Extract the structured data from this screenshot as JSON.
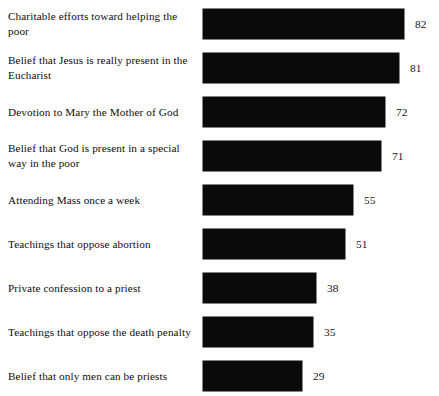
{
  "chart_data": {
    "type": "bar",
    "orientation": "horizontal",
    "title": "",
    "subtitle": "",
    "xlabel": "",
    "ylabel": "",
    "grid": false,
    "legend": null,
    "axis_visible": false,
    "tick_labels": [],
    "value_labels_shown": true,
    "bar_color": "#0a0a0a",
    "background_color": "#ffffff",
    "xlim": [
      0,
      100
    ],
    "categories": [
      "Charitable efforts toward helping the poor",
      "Belief that Jesus is really present in the Eucharist",
      "Devotion to Mary the Mother of God",
      "Belief that God is present in a special way in the poor",
      "Attending Mass once a week",
      "Teachings that oppose abortion",
      "Private confession to a priest",
      "Teachings that oppose the death penalty",
      "Belief that only men can be priests"
    ],
    "values": [
      82,
      81,
      72,
      71,
      55,
      51,
      38,
      35,
      29
    ],
    "bars": [
      {
        "label": "Charitable efforts toward helping the poor",
        "value": 82,
        "value_text": "82",
        "pixel_width": 201
      },
      {
        "label": "Belief that Jesus is really present in the Eucharist",
        "value": 81,
        "value_text": "81",
        "pixel_width": 196
      },
      {
        "label": "Devotion to Mary the Mother of God",
        "value": 72,
        "value_text": "72",
        "pixel_width": 182
      },
      {
        "label": "Belief that God is present in a special way in the poor",
        "value": 71,
        "value_text": "71",
        "pixel_width": 178
      },
      {
        "label": "Attending Mass once a week",
        "value": 55,
        "value_text": "55",
        "pixel_width": 150
      },
      {
        "label": "Teachings that oppose abortion",
        "value": 51,
        "value_text": "51",
        "pixel_width": 142
      },
      {
        "label": "Private confession to a priest",
        "value": 38,
        "value_text": "38",
        "pixel_width": 113
      },
      {
        "label": "Teachings that oppose the death penalty",
        "value": 35,
        "value_text": "35",
        "pixel_width": 110
      },
      {
        "label": "Belief that only men can be priests",
        "value": 29,
        "value_text": "29",
        "pixel_width": 99
      }
    ]
  }
}
